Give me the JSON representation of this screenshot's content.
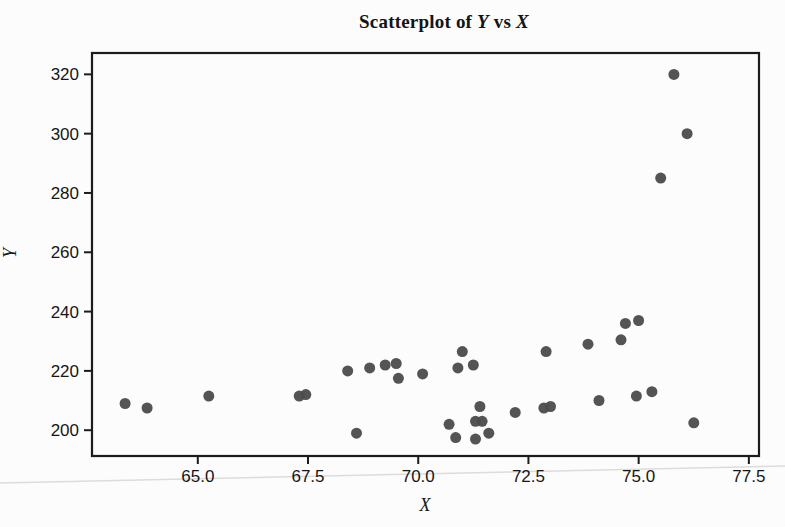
{
  "figure": {
    "title_parts": {
      "prefix": "Scatterplot of ",
      "y_var": "Y",
      "vs": " vs ",
      "x_var": "X"
    }
  },
  "chart_data": {
    "type": "scatter",
    "title": "Scatterplot of Y vs X",
    "xlabel": "X",
    "ylabel": "Y",
    "xlim": [
      62.6,
      77.73
    ],
    "ylim": [
      191.3,
      327.2
    ],
    "x_ticks": [
      65.0,
      67.5,
      70.0,
      72.5,
      75.0,
      77.5
    ],
    "x_tick_labels": [
      "65.0",
      "67.5",
      "70.0",
      "72.5",
      "75.0",
      "77.5"
    ],
    "y_ticks": [
      200,
      220,
      240,
      260,
      280,
      300,
      320
    ],
    "grid": false,
    "legend": "none",
    "marker_color": "#4c4c4c",
    "axis_color": "#1c1c1c",
    "tick_label_color": "#161616",
    "background_color": "#fcfcfc",
    "scan_artifact_color": "#dcdcdc",
    "points": [
      [
        63.35,
        209
      ],
      [
        63.85,
        207.5
      ],
      [
        65.25,
        211.5
      ],
      [
        67.3,
        211.5
      ],
      [
        67.45,
        212
      ],
      [
        68.4,
        220
      ],
      [
        68.6,
        199
      ],
      [
        68.9,
        221
      ],
      [
        69.25,
        222
      ],
      [
        69.5,
        222.5
      ],
      [
        69.55,
        217.5
      ],
      [
        70.1,
        219
      ],
      [
        70.7,
        202
      ],
      [
        70.85,
        197.5
      ],
      [
        70.9,
        221
      ],
      [
        71.0,
        226.5
      ],
      [
        71.25,
        222
      ],
      [
        71.3,
        197
      ],
      [
        71.3,
        203
      ],
      [
        71.45,
        203
      ],
      [
        71.4,
        208
      ],
      [
        71.6,
        199
      ],
      [
        72.2,
        206
      ],
      [
        72.85,
        207.5
      ],
      [
        72.9,
        226.5
      ],
      [
        73.0,
        208
      ],
      [
        73.85,
        229
      ],
      [
        74.1,
        210
      ],
      [
        74.6,
        230.5
      ],
      [
        74.7,
        236
      ],
      [
        74.95,
        211.5
      ],
      [
        75.0,
        237
      ],
      [
        75.3,
        213
      ],
      [
        75.5,
        285
      ],
      [
        75.8,
        320
      ],
      [
        76.1,
        300
      ],
      [
        76.25,
        202.5
      ]
    ]
  }
}
